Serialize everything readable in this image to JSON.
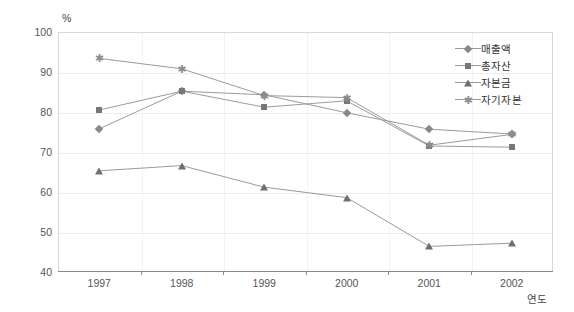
{
  "chart_data": {
    "type": "line",
    "title": "",
    "unit_label": "%",
    "xlabel": "연도",
    "ylabel": "",
    "categories": [
      "1997",
      "1998",
      "1999",
      "2000",
      "2001",
      "2002"
    ],
    "ylim": [
      40,
      100
    ],
    "yticks": [
      40,
      50,
      60,
      70,
      80,
      90,
      100
    ],
    "grid": true,
    "legend_position": "top-right",
    "series": [
      {
        "name": "매출액",
        "marker": "diamond",
        "color": "#888888",
        "values": [
          75.8,
          85.2,
          84.3,
          79.8,
          75.7,
          74.5
        ]
      },
      {
        "name": "총자산",
        "marker": "square",
        "color": "#777777",
        "values": [
          80.5,
          85.2,
          81.2,
          82.8,
          71.5,
          71.2
        ]
      },
      {
        "name": "자본금",
        "marker": "triangle",
        "color": "#6f6f6f",
        "values": [
          65.3,
          66.6,
          61.2,
          58.6,
          46.4,
          47.2
        ]
      },
      {
        "name": "자기자본",
        "marker": "star",
        "color": "#8d8d8d",
        "values": [
          93.4,
          90.8,
          84.1,
          83.6,
          71.7,
          74.4
        ]
      }
    ]
  },
  "legend": {
    "items": [
      {
        "label": "매출액"
      },
      {
        "label": "총자산"
      },
      {
        "label": "자본금"
      },
      {
        "label": "자기자본"
      }
    ]
  },
  "axes": {
    "y_tick_labels": [
      "100",
      "90",
      "80",
      "70",
      "60",
      "50",
      "40"
    ],
    "x_tick_labels": [
      "1997",
      "1998",
      "1999",
      "2000",
      "2001",
      "2002"
    ],
    "unit": "%",
    "x_title": "연도"
  }
}
